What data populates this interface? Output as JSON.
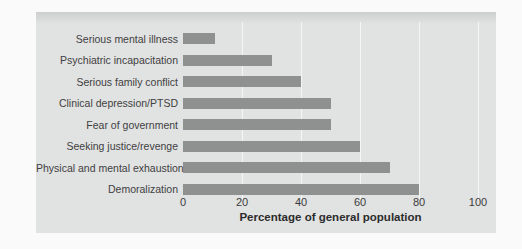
{
  "chart_data": {
    "type": "bar",
    "orientation": "horizontal",
    "categories": [
      "Serious mental illness",
      "Psychiatric incapacitation",
      "Serious family conflict",
      "Clinical depression/PTSD",
      "Fear of government",
      "Seeking justice/revenge",
      "Physical and mental exhaustion",
      "Demoralization"
    ],
    "values": [
      11,
      30,
      40,
      50,
      50,
      60,
      70,
      80
    ],
    "xlabel": "Percentage of general population",
    "xlim": [
      0,
      100
    ],
    "xticks": [
      0,
      20,
      40,
      60,
      80,
      100
    ],
    "grid": "vertical white gridlines at ticks, none at 0",
    "legend": "none",
    "colors": {
      "bar": "#8f9090",
      "panel_bg": "#e1e2e2",
      "panel_top_shade": "#cdcfcf",
      "page_bg": "#fafafa",
      "gridline": "#f4f5f5",
      "category_text": "#3f3f3f",
      "tick_text": "#3c3c3c",
      "axis_label_text": "#2c2c2c"
    }
  }
}
